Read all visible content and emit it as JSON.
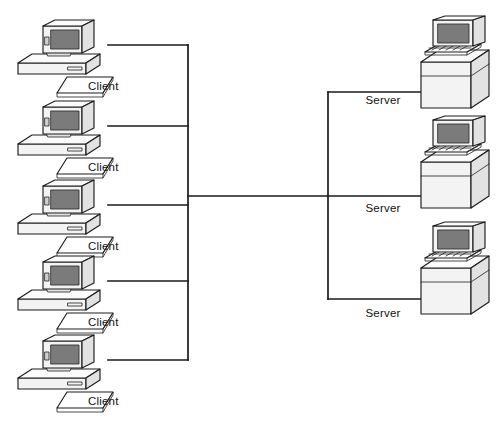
{
  "diagram": {
    "type": "network-topology",
    "background_color": "#ffffff",
    "line_color": "#1a1a1a",
    "screen_color": "#7b7b7b",
    "canvas": {
      "width": 503,
      "height": 424
    }
  },
  "labels": {
    "client": "Client",
    "server": "Server"
  },
  "clients": [
    {
      "id": "client-1",
      "label": "Client",
      "icon": "desktop-computer-icon",
      "x": 10,
      "y": 18,
      "label_x": 88,
      "label_y": 90,
      "link_y": 45
    },
    {
      "id": "client-2",
      "label": "Client",
      "icon": "desktop-computer-icon",
      "x": 10,
      "y": 99,
      "label_x": 88,
      "label_y": 171,
      "link_y": 126
    },
    {
      "id": "client-3",
      "label": "Client",
      "icon": "desktop-computer-icon",
      "x": 10,
      "y": 178,
      "label_x": 88,
      "label_y": 250,
      "link_y": 205
    },
    {
      "id": "client-4",
      "label": "Client",
      "icon": "desktop-computer-icon",
      "x": 10,
      "y": 254,
      "label_x": 88,
      "label_y": 326,
      "link_y": 281
    },
    {
      "id": "client-5",
      "label": "Client",
      "icon": "desktop-computer-icon",
      "x": 10,
      "y": 333,
      "label_x": 88,
      "label_y": 405,
      "link_y": 360
    }
  ],
  "servers": [
    {
      "id": "server-1",
      "label": "Server",
      "icon": "server-tower-icon",
      "x": 415,
      "y": 16,
      "label_x": 383,
      "label_y": 104,
      "link_y": 92
    },
    {
      "id": "server-2",
      "label": "Server",
      "icon": "server-tower-icon",
      "x": 415,
      "y": 116,
      "label_x": 383,
      "label_y": 212,
      "link_y": 196
    },
    {
      "id": "server-3",
      "label": "Server",
      "icon": "server-tower-icon",
      "x": 415,
      "y": 222,
      "label_x": 383,
      "label_y": 317,
      "link_y": 299
    }
  ],
  "bus": {
    "client_bus_x": 188,
    "client_bus_top": 45,
    "client_bus_bottom": 360,
    "server_bus_x": 328,
    "server_bus_top": 92,
    "server_bus_bottom": 299,
    "trunk_y": 196,
    "client_stub_x": 108,
    "server_stub_x": 425
  }
}
